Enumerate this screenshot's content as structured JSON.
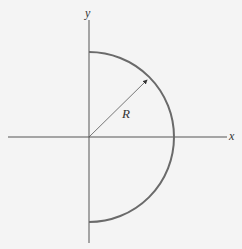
{
  "diagram": {
    "axes": {
      "x_label": "x",
      "y_label": "y"
    },
    "radius_label": "R",
    "colors": {
      "axis": "#555555",
      "arc": "#6a6a6a",
      "radius_line": "#555555",
      "background": "#f4f4f4",
      "text": "#333333"
    }
  }
}
